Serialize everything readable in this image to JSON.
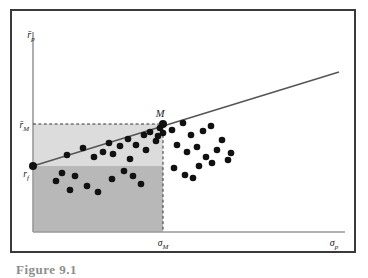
{
  "figure": {
    "caption": "Figure 9.1",
    "frame_color": "#3a3a3a",
    "background": "#ffffff"
  },
  "axes": {
    "y_axis_label": "r̄p",
    "x_axis_label": "σp",
    "axis_color": "#9a9a9a",
    "y_tick_label": "r̄M",
    "x_tick_label": "σM"
  },
  "points": {
    "tangency_label": "M",
    "intercept_label": "rf",
    "marker_color": "#111111"
  },
  "regions": {
    "upper_band_color": "#dcdcdc",
    "lower_band_color": "#b8b8b8"
  },
  "line": {
    "name": "capital-market-line",
    "color": "#555555"
  },
  "chart_data": {
    "type": "scatter",
    "title": "",
    "subtitle": "",
    "xlabel": "σp",
    "ylabel": "r̄p",
    "xlim": [
      0,
      100
    ],
    "ylim": [
      0,
      100
    ],
    "grid": false,
    "legend": null,
    "annotations": [
      {
        "text": "M",
        "x": 44.0,
        "y": 62.5,
        "role": "tangency-portfolio"
      },
      {
        "text": "rf",
        "x": 0.0,
        "y": 40.5,
        "role": "risk-free-rate"
      },
      {
        "text": "r̄M",
        "x": 0.0,
        "y": 62.5,
        "role": "y-tick"
      },
      {
        "text": "σM",
        "x": 44.0,
        "y": 0.0,
        "role": "x-tick"
      }
    ],
    "series": [
      {
        "name": "capital-market-line",
        "type": "line",
        "x": [
          0.0,
          100.0
        ],
        "y": [
          40.5,
          84.0
        ]
      },
      {
        "name": "risk-free-asset",
        "type": "point",
        "x": [
          0.0
        ],
        "y": [
          40.5
        ]
      },
      {
        "name": "market-portfolio",
        "type": "point",
        "x": [
          44.0
        ],
        "y": [
          62.5
        ]
      },
      {
        "name": "individual-assets",
        "type": "scatter",
        "x": [
          11.0,
          16.0,
          19.5,
          13.5,
          22.5,
          24.5,
          28.0,
          26.0,
          30.5,
          33.0,
          35.5,
          31.0,
          37.5,
          39.5,
          41.0,
          36.0,
          42.5,
          40.0,
          7.5,
          12.0,
          9.5,
          17.5,
          21.0,
          25.5,
          29.0,
          32.0,
          34.5,
          46.5,
          49.5,
          52.0,
          55.5,
          58.0,
          61.0,
          48.0,
          51.0,
          54.0,
          57.0,
          60.5,
          63.5,
          47.0,
          50.5,
          56.0,
          59.5,
          64.5,
          53.0
        ],
        "y": [
          44.0,
          47.5,
          42.5,
          33.5,
          45.5,
          50.0,
          48.5,
          44.5,
          52.0,
          49.0,
          53.5,
          41.0,
          55.0,
          51.5,
          57.5,
          46.5,
          59.0,
          54.5,
          31.5,
          27.0,
          35.0,
          29.5,
          26.5,
          32.5,
          36.5,
          34.0,
          30.0,
          58.0,
          61.5,
          55.5,
          57.0,
          59.5,
          53.0,
          51.0,
          48.0,
          50.5,
          46.0,
          49.0,
          44.0,
          40.5,
          38.0,
          41.5,
          43.0,
          47.0,
          33.0
        ]
      }
    ]
  }
}
